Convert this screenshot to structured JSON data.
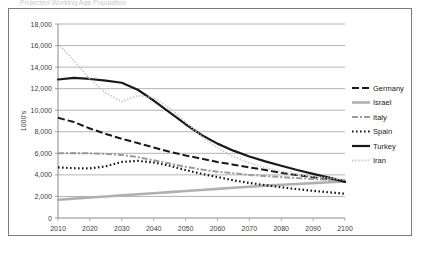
{
  "figure": {
    "frame_border_color": "#7a7a7a",
    "background": "#ffffff",
    "partial_title": "Projected Working Age Population"
  },
  "chart_data": {
    "type": "line",
    "title": "",
    "xlabel": "",
    "ylabel": "1000's",
    "xlim": [
      2010,
      2100
    ],
    "ylim": [
      0,
      18000
    ],
    "ytick_step": 2000,
    "xtick_step": 10,
    "grid": "horizontal",
    "legend_position": "right",
    "x": [
      2010,
      2015,
      2020,
      2025,
      2030,
      2035,
      2040,
      2045,
      2050,
      2055,
      2060,
      2065,
      2070,
      2075,
      2080,
      2085,
      2090,
      2095,
      2100
    ],
    "xticklabels": [
      "2010",
      "2020",
      "2030",
      "2040",
      "2050",
      "2060",
      "2070",
      "2080",
      "2090",
      "2100"
    ],
    "yticklabels": [
      "0",
      "2,000",
      "4,000",
      "6,000",
      "8,000",
      "10,000",
      "12,000",
      "14,000",
      "16,000",
      "18,000"
    ],
    "series": [
      {
        "name": "Germany",
        "style": "dashed",
        "color": "#1a1a1a",
        "width": 2.0,
        "dash": "7,3",
        "values": [
          9300,
          8900,
          8300,
          7800,
          7350,
          6950,
          6550,
          6150,
          5800,
          5500,
          5200,
          4950,
          4700,
          4450,
          4200,
          3980,
          3780,
          3600,
          3450
        ]
      },
      {
        "name": "Israel",
        "style": "solid",
        "color": "#b0b0b0",
        "width": 2.6,
        "dash": "none",
        "values": [
          1700,
          1800,
          1900,
          2000,
          2100,
          2200,
          2300,
          2400,
          2500,
          2600,
          2700,
          2800,
          2900,
          3000,
          3080,
          3160,
          3240,
          3320,
          3400
        ]
      },
      {
        "name": "Italy",
        "style": "dash-dot",
        "color": "#9a9a9a",
        "width": 2.0,
        "dash": "6,2,2,2",
        "values": [
          6000,
          6020,
          6000,
          5950,
          5850,
          5650,
          5350,
          5050,
          4750,
          4500,
          4300,
          4150,
          4000,
          3900,
          3800,
          3700,
          3620,
          3540,
          3480
        ]
      },
      {
        "name": "Spain",
        "style": "dotted",
        "color": "#1a1a1a",
        "width": 2.2,
        "dash": "1.6,2.4",
        "values": [
          4700,
          4620,
          4600,
          4800,
          5200,
          5300,
          5150,
          4850,
          4450,
          4100,
          3800,
          3500,
          3250,
          3050,
          2850,
          2680,
          2520,
          2380,
          2250
        ]
      },
      {
        "name": "Turkey",
        "style": "solid",
        "color": "#1a1a1a",
        "width": 2.2,
        "dash": "none",
        "values": [
          12850,
          13000,
          12900,
          12750,
          12550,
          11900,
          10900,
          9800,
          8700,
          7700,
          6900,
          6250,
          5700,
          5250,
          4850,
          4450,
          4100,
          3750,
          3350
        ]
      },
      {
        "name": "Iran",
        "style": "fine-dotted",
        "color": "#c4c4c4",
        "width": 1.8,
        "dash": "1.3,1.8",
        "values": [
          16200,
          14600,
          12900,
          11600,
          10800,
          11350,
          11150,
          10200,
          8900,
          7600,
          6500,
          5700,
          5100,
          4650,
          4300,
          4050,
          3850,
          3700,
          3550
        ]
      }
    ]
  }
}
